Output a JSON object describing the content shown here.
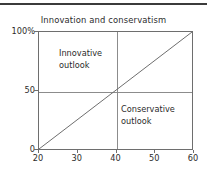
{
  "figure": {
    "title": "Innovation and conservatism",
    "has_top_rule": true,
    "frame_color": "#6e6e6e",
    "gridline_color": "#8c8c8c",
    "trend_color": "#6e6e6e",
    "text_color": "#2b2b2b",
    "background": "#ffffff"
  },
  "chart_data": {
    "type": "line",
    "title": "Innovation and conservatism",
    "xlabel": "",
    "ylabel": "",
    "xlim": [
      20,
      60
    ],
    "ylim": [
      0,
      100
    ],
    "grid": true,
    "legend_position": "none",
    "x_ticks": [
      "20",
      "30",
      "40",
      "50",
      "60"
    ],
    "x_tick_values": [
      20,
      30,
      40,
      50,
      60
    ],
    "y_ticks": [
      "0",
      "50",
      "100%"
    ],
    "y_tick_values": [
      0,
      50,
      100
    ],
    "gridlines": {
      "vertical_at_x": 40,
      "horizontal_at_y": 50
    },
    "series": [
      {
        "name": "diagonal",
        "x": [
          20,
          60
        ],
        "values": [
          0,
          100
        ]
      }
    ],
    "annotations": [
      {
        "name": "innovative-outlook",
        "text": "Innovative\noutlook",
        "quadrant": "top-left",
        "x": 45,
        "y": 80
      },
      {
        "name": "conservative-outlook",
        "text": "Conservative\noutlook",
        "quadrant": "bottom-right",
        "x": 50,
        "y": 28
      }
    ]
  }
}
